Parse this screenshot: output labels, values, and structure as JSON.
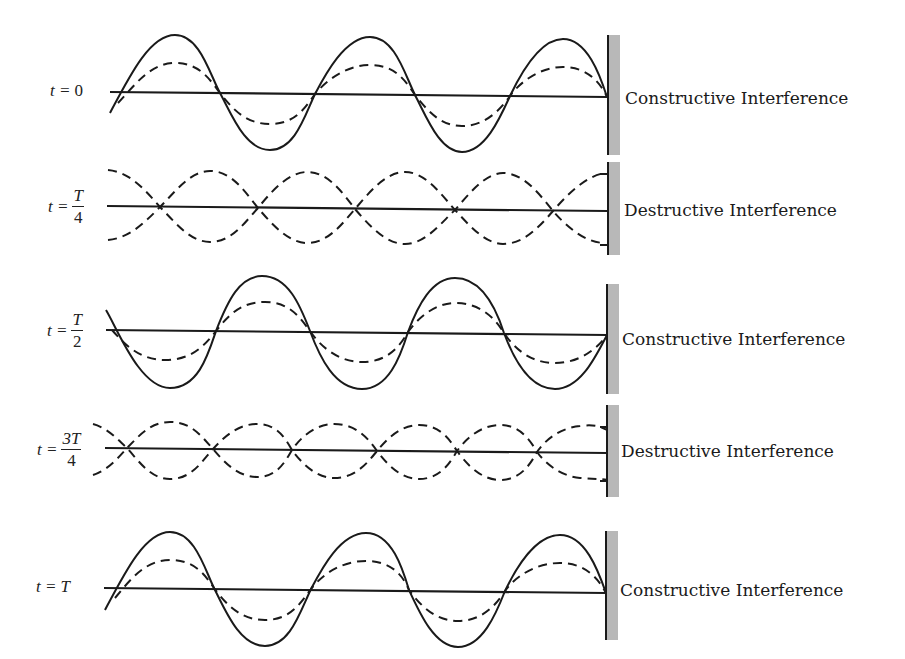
{
  "diagram": {
    "title": "",
    "rows": [
      {
        "time_label": "t = 0",
        "time_prefix": "t =",
        "time_value": "0",
        "fraction": false,
        "interference": "Constructive Interference",
        "type": "constructive",
        "phase": 0
      },
      {
        "time_label": "t = T/4",
        "time_prefix": "t =",
        "numerator": "T",
        "denominator": "4",
        "fraction": true,
        "interference": "Destructive Interference",
        "type": "destructive"
      },
      {
        "time_label": "t = T/2",
        "time_prefix": "t =",
        "numerator": "T",
        "denominator": "2",
        "fraction": true,
        "interference": "Constructive Interference",
        "type": "constructive",
        "phase": 180
      },
      {
        "time_label": "t = 3T/4",
        "time_prefix": "t =",
        "numerator": "3T",
        "denominator": "4",
        "fraction": true,
        "interference": "Destructive Interference",
        "type": "destructive"
      },
      {
        "time_label": "t = T",
        "time_prefix": "t =",
        "time_value": "T",
        "fraction": false,
        "interference": "Constructive Interference",
        "type": "constructive",
        "phase": 0
      }
    ],
    "legend": {
      "solid": "resultant wave",
      "dashed": "incident and reflected waves"
    },
    "colors": {
      "line": "#1a1a1a",
      "wall": "#b8b8b8",
      "background": "#ffffff"
    }
  }
}
